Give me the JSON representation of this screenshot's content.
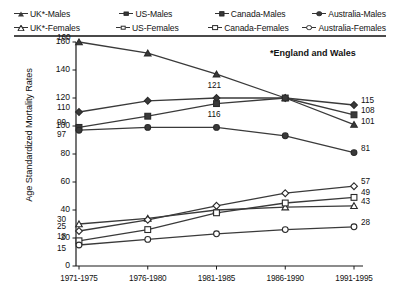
{
  "chart_data": {
    "type": "line",
    "title": "",
    "xlabel": "",
    "ylabel": "Age Standardized Mortality Rates",
    "categories": [
      "1971-1975",
      "1976-1980",
      "1981-1985",
      "1986-1990",
      "1991-1995"
    ],
    "ylim": [
      0,
      160
    ],
    "yticks": [
      0,
      20,
      40,
      60,
      80,
      100,
      120,
      140,
      160
    ],
    "grid": false,
    "legend_position": "top",
    "annotations": [
      "*England and Wales"
    ],
    "series": [
      {
        "name": "UK*-Males",
        "marker": "triangle-filled",
        "values": [
          160,
          152,
          137,
          120,
          101
        ]
      },
      {
        "name": "US-Males",
        "marker": "diamond-filled",
        "values": [
          110,
          118,
          120,
          120,
          115
        ]
      },
      {
        "name": "Canada-Males",
        "marker": "square-filled",
        "values": [
          99,
          107,
          116,
          120,
          108
        ]
      },
      {
        "name": "Australia-Males",
        "marker": "circle-filled",
        "values": [
          97,
          99,
          99,
          93,
          81
        ]
      },
      {
        "name": "UK*-Females",
        "marker": "triangle-open",
        "values": [
          30,
          34,
          40,
          42,
          43
        ]
      },
      {
        "name": "US-Females",
        "marker": "diamond-open",
        "values": [
          25,
          33,
          43,
          52,
          57
        ]
      },
      {
        "name": "Canada-Females",
        "marker": "square-open",
        "values": [
          18,
          26,
          38,
          45,
          49
        ]
      },
      {
        "name": "Australia-Females",
        "marker": "circle-open",
        "values": [
          15,
          19,
          23,
          26,
          28
        ]
      }
    ],
    "point_labels_left": [
      160,
      110,
      99,
      97,
      30,
      25,
      18,
      15
    ],
    "point_labels_mid": [
      121,
      116
    ],
    "point_labels_right": [
      115,
      108,
      101,
      81,
      57,
      49,
      43,
      28
    ]
  },
  "legend": {
    "rows": [
      [
        {
          "label": "UK*-Males",
          "marker": "triangle-filled"
        },
        {
          "label": "US-Males",
          "marker": "diamond-filled"
        },
        {
          "label": "Canada-Males",
          "marker": "square-filled"
        },
        {
          "label": "Australia-Males",
          "marker": "circle-filled"
        }
      ],
      [
        {
          "label": "UK*-Females",
          "marker": "triangle-open"
        },
        {
          "label": "US-Females",
          "marker": "diamond-open"
        },
        {
          "label": "Canada-Females",
          "marker": "square-open"
        },
        {
          "label": "Australia-Females",
          "marker": "circle-open"
        }
      ]
    ]
  },
  "note": "*England and Wales",
  "colors": {
    "line": "#3a3a3a",
    "axis": "#1a1a1a",
    "text": "#111111",
    "background": "#ffffff"
  }
}
